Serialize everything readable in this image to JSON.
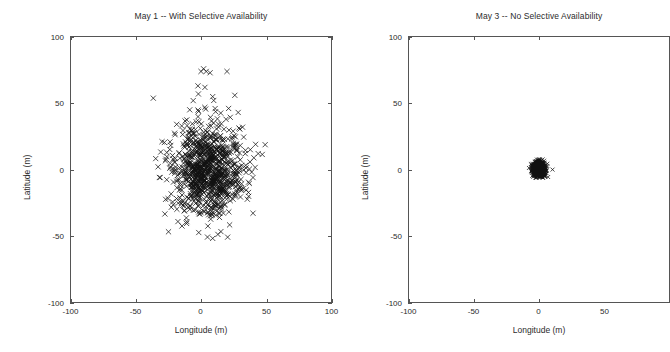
{
  "figure": {
    "background": "#ffffff",
    "marker_color": "#111111",
    "axis_color": "#555555",
    "marker_symbol": "x"
  },
  "panels": [
    {
      "id": "left",
      "title": "May 1 -- With Selective Availability",
      "xlabel": "Longitude  (m)",
      "ylabel": "Latitude  (m)",
      "xticks": [
        "-100",
        "-50",
        "0",
        "50",
        "100"
      ],
      "yticks": [
        "100",
        "50",
        "0",
        "-50",
        "-100"
      ]
    },
    {
      "id": "right",
      "title": "May 3 -- No Selective Availability",
      "xlabel": "Longitude  (m)",
      "ylabel": "Latitude  (m)",
      "xticks": [
        "-100",
        "-50",
        "0",
        "50"
      ],
      "yticks": [
        "100",
        "50",
        "0",
        "-50",
        "-100"
      ]
    }
  ],
  "chart_data": [
    {
      "type": "scatter",
      "title": "May 1 -- With Selective Availability",
      "xlabel": "Longitude  (m)",
      "ylabel": "Latitude  (m)",
      "xlim": [
        -100,
        100
      ],
      "ylim": [
        -100,
        100
      ],
      "xticks": [
        -100,
        -50,
        0,
        50,
        100
      ],
      "yticks": [
        -100,
        -50,
        0,
        50,
        100
      ],
      "grid": false,
      "legend": false,
      "marker": "x",
      "series": [
        {
          "name": "GPS position fixes (SA on)",
          "n_points": 980,
          "center": [
            6,
            0
          ],
          "spread_x": 14,
          "spread_y": 17,
          "notes": "Dense isotropic cloud, ~95% within +/-40 m; sparse outliers to +75 m latitude.",
          "outliers": [
            [
              0,
              74
            ],
            [
              2,
              76
            ],
            [
              4,
              74
            ],
            [
              7,
              73
            ],
            [
              20,
              74
            ],
            [
              -2,
              57
            ],
            [
              26,
              56
            ],
            [
              3,
              62
            ],
            [
              -6,
              52
            ],
            [
              9,
              55
            ],
            [
              -25,
              -47
            ],
            [
              5,
              -51
            ],
            [
              9,
              -52
            ],
            [
              13,
              -49
            ],
            [
              -30,
              21
            ],
            [
              40,
              -33
            ],
            [
              42,
              19
            ],
            [
              -33,
              2
            ],
            [
              -32,
              -6
            ],
            [
              44,
              12
            ]
          ]
        }
      ]
    },
    {
      "type": "scatter",
      "title": "May 3 -- No Selective Availability",
      "xlabel": "Longitude  (m)",
      "ylabel": "Latitude  (m)",
      "xlim": [
        -100,
        100
      ],
      "ylim": [
        -100,
        100
      ],
      "xticks": [
        -100,
        -50,
        0,
        50
      ],
      "yticks": [
        -100,
        -50,
        0,
        50,
        100
      ],
      "grid": false,
      "legend": false,
      "marker": "x",
      "series": [
        {
          "name": "GPS position fixes (SA off)",
          "n_points": 980,
          "center": [
            0,
            0
          ],
          "spread_x": 2.2,
          "spread_y": 2.6,
          "notes": "Very tight cluster at the origin, essentially all points within +/-6 m.",
          "outliers": []
        }
      ]
    }
  ]
}
